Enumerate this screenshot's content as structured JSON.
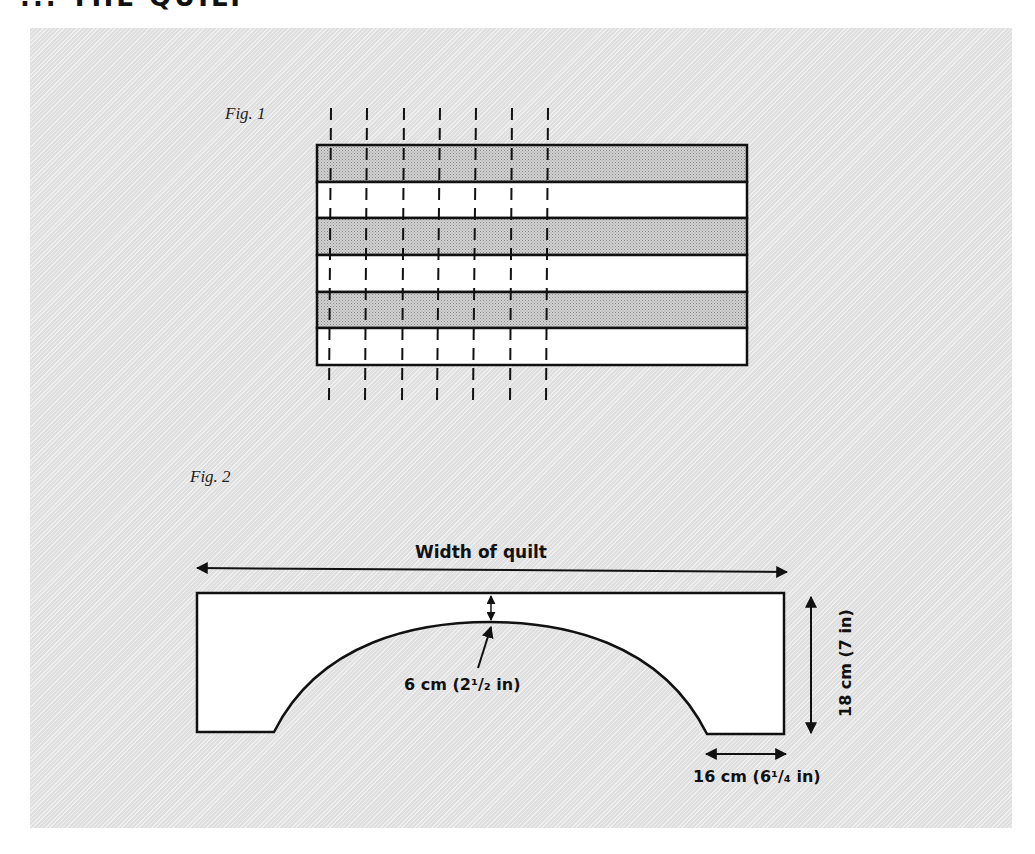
{
  "page": {
    "heading_fragment": "... THE QUILT"
  },
  "fig1": {
    "label": "Fig. 1",
    "strips": [
      {
        "index": 1,
        "fill": "shaded"
      },
      {
        "index": 2,
        "fill": "white"
      },
      {
        "index": 3,
        "fill": "shaded"
      },
      {
        "index": 4,
        "fill": "white"
      },
      {
        "index": 5,
        "fill": "shaded"
      },
      {
        "index": 6,
        "fill": "white"
      }
    ],
    "cut_lines_count": 7
  },
  "fig2": {
    "label": "Fig. 2",
    "width_label": "Width of quilt",
    "top_gap_label": "6 cm (2¹/₂ in)",
    "height_label": "18 cm (7 in)",
    "foot_label": "16 cm (6¹/₄ in)"
  },
  "colors": {
    "panel_bg": "#e6e6e6",
    "shaded_strip": "#c4c4c4",
    "line": "#111111"
  }
}
